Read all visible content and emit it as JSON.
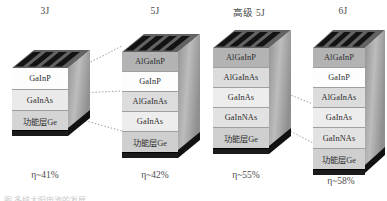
{
  "figure": {
    "kind": "multi-junction solar cell layer stack diagram",
    "colors": {
      "layer_AlGaInP": "#b3b3b3",
      "layer_GaInP": "#fdfdfd",
      "layer_AlGaInAs": "#dcdcdc",
      "layer_GaInAs": "#ececec",
      "layer_GaInNAs": "#e3e3e3",
      "layer_Ge": "#cfcfcf",
      "side_face": "#a8a8a8",
      "top_face": "#6f6f6f",
      "grid_finger": "#141414",
      "base_contact": "#1b1b1b",
      "connector_line": "#8d8d8d",
      "text": "#3a3a3a"
    }
  },
  "cells": [
    {
      "header": "3J",
      "efficiency": "η~41%",
      "eta_symbol": "η",
      "eta_value": "41%",
      "layers": [
        {
          "name": "GaInP",
          "fill": "#fdfdfd"
        },
        {
          "name": "GaInAs",
          "fill": "#eaeaea"
        },
        {
          "name": "功能层Ge",
          "fill": "#d4d4d4"
        }
      ]
    },
    {
      "header": "5J",
      "efficiency": "η~42%",
      "eta_symbol": "η",
      "eta_value": "42%",
      "layers": [
        {
          "name": "AlGaInP",
          "fill": "#b3b3b3"
        },
        {
          "name": "GaInP",
          "fill": "#fdfdfd"
        },
        {
          "name": "AlGaInAs",
          "fill": "#dcdcdc"
        },
        {
          "name": "GaInAs",
          "fill": "#ededed"
        },
        {
          "name": "功能层Ge",
          "fill": "#cfcfcf"
        }
      ]
    },
    {
      "header": "高级 5J",
      "efficiency": "η~55%",
      "eta_symbol": "η",
      "eta_value": "55%",
      "layers": [
        {
          "name": "AlGaInP",
          "fill": "#b3b3b3"
        },
        {
          "name": "AlGaInAs",
          "fill": "#dcdcdc"
        },
        {
          "name": "GaInAs",
          "fill": "#ededed"
        },
        {
          "name": "GaInNAs",
          "fill": "#e2e2e2"
        },
        {
          "name": "功能层Ge",
          "fill": "#cfcfcf"
        }
      ]
    },
    {
      "header": "6J",
      "efficiency": "η~58%",
      "eta_symbol": "η",
      "eta_value": "58%",
      "layers": [
        {
          "name": "AlGaInP",
          "fill": "#b3b3b3"
        },
        {
          "name": "GaInP",
          "fill": "#fdfdfd"
        },
        {
          "name": "AlGaInAs",
          "fill": "#dcdcdc"
        },
        {
          "name": "GaInAs",
          "fill": "#ededed"
        },
        {
          "name": "GaInNAs",
          "fill": "#e2e2e2"
        },
        {
          "name": "功能层Ge",
          "fill": "#cfcfcf"
        }
      ]
    }
  ],
  "caption": "图 多结太阳电池的发展"
}
